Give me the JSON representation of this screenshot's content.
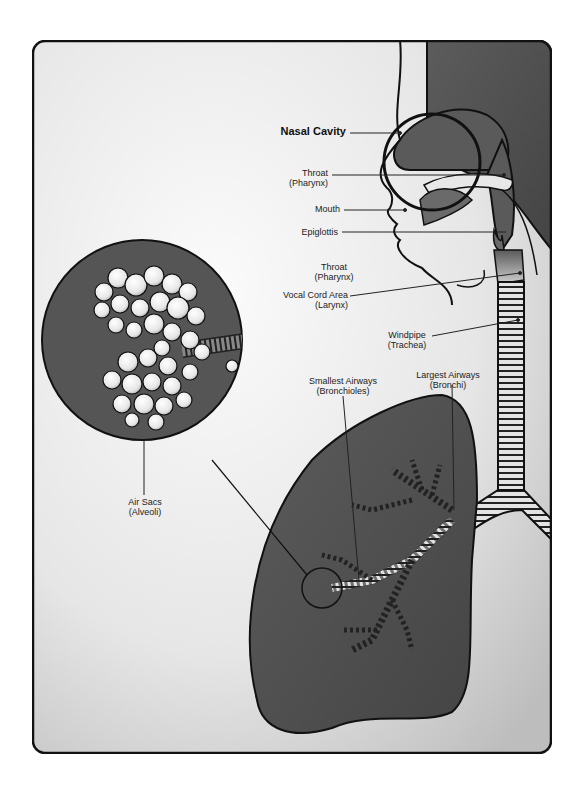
{
  "diagram": {
    "colors": {
      "background_light": "#f4f4f4",
      "background_shade": "#c8c8c8",
      "tissue_dark": "#555555",
      "tissue_mid": "#7a7a7a",
      "airway_light": "#e8e8e8",
      "outline": "#111111"
    },
    "labels": {
      "nasal_cavity": "Nasal Cavity",
      "throat_upper": {
        "line1": "Throat",
        "line2": "(Pharynx)"
      },
      "mouth": "Mouth",
      "epiglottis": "Epiglottis",
      "throat_lower": {
        "line1": "Throat",
        "line2": "(Pharynx)"
      },
      "larynx": {
        "line1": "Vocal Cord Area",
        "line2": "(Larynx)"
      },
      "trachea": {
        "line1": "Windpipe",
        "line2": "(Trachea)"
      },
      "bronchi": {
        "line1": "Largest Airways",
        "line2": "(Bronchi)"
      },
      "bronchioles": {
        "line1": "Smallest Airways",
        "line2": "(Bronchioles)"
      },
      "alveoli": {
        "line1": "Air Sacs",
        "line2": "(Alveoli)"
      }
    }
  }
}
